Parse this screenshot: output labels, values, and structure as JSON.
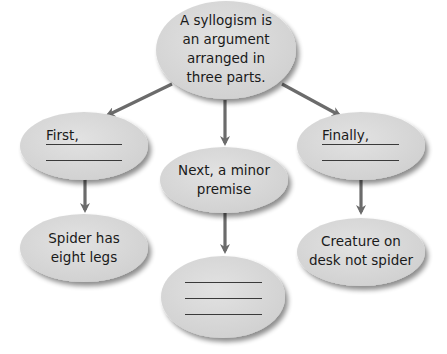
{
  "diagram": {
    "type": "concept-map",
    "colors": {
      "node_fill": "#d9d9d9",
      "node_shadow": "#9a9a9a",
      "arrow": "#6b6b6b",
      "text": "#1a1a1a"
    },
    "nodes": {
      "root": {
        "text_lines": [
          "A syllogism is",
          "an argument",
          "arranged in",
          "three parts."
        ]
      },
      "first": {
        "label": "First,",
        "blank_lines": 2
      },
      "next": {
        "text_lines": [
          "Next, a minor",
          "premise"
        ]
      },
      "finally": {
        "label": "Finally,",
        "blank_lines": 2
      },
      "spider": {
        "text_lines": [
          "Spider has",
          "eight legs"
        ]
      },
      "minor_blank": {
        "blank_lines": 3
      },
      "creature": {
        "text_lines": [
          "Creature on",
          "desk not spider"
        ]
      }
    },
    "edges": [
      {
        "from": "root",
        "to": "first"
      },
      {
        "from": "root",
        "to": "next"
      },
      {
        "from": "root",
        "to": "finally"
      },
      {
        "from": "first",
        "to": "spider"
      },
      {
        "from": "next",
        "to": "minor_blank"
      },
      {
        "from": "finally",
        "to": "creature"
      }
    ]
  }
}
